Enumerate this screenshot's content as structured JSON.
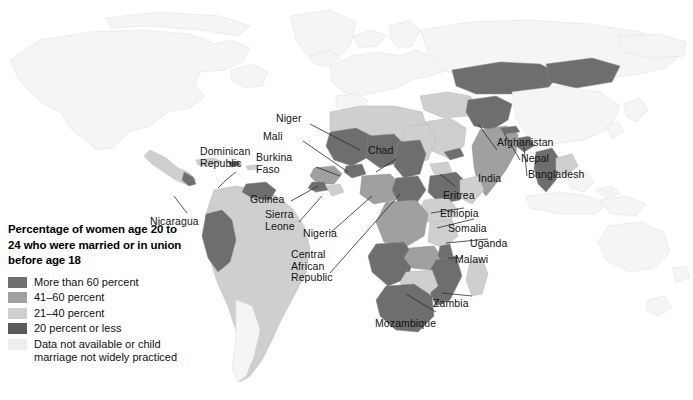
{
  "figure": {
    "kind": "choropleth-world-map",
    "background_color": "#ffffff"
  },
  "legend": {
    "title": "Percentage of women age 20 to 24 who were married or in union before age 18",
    "title_lines": [
      "Percentage of women",
      "age 20 to 24 who were",
      "married or in union before",
      "age 18"
    ],
    "items": [
      {
        "label": "More than 60 percent",
        "color": "#6e6e6e"
      },
      {
        "label": "41–60 percent",
        "color": "#a0a0a0"
      },
      {
        "label": "21–40 percent",
        "color": "#cfcfcf"
      },
      {
        "label": "20 percent or less",
        "color": "#5a5a5a"
      },
      {
        "label": "Data not available or child marriage not widely practiced",
        "color": "#eceeee"
      }
    ]
  },
  "map_labels": [
    {
      "name": "Niger",
      "text": "Niger"
    },
    {
      "name": "Mali",
      "text": "Mali"
    },
    {
      "name": "Burkina Faso",
      "text": "Burkina\nFaso"
    },
    {
      "name": "Chad",
      "text": "Chad"
    },
    {
      "name": "Afghanistan",
      "text": "Afghanistan"
    },
    {
      "name": "Nepal",
      "text": "Nepal"
    },
    {
      "name": "Bangladesh",
      "text": "Bangladesh"
    },
    {
      "name": "India",
      "text": "India"
    },
    {
      "name": "Dominican Republic",
      "text": "Dominican\nRepublic"
    },
    {
      "name": "Guinea",
      "text": "Guinea"
    },
    {
      "name": "Sierra Leone",
      "text": "Sierra\nLeone"
    },
    {
      "name": "Nicaragua",
      "text": "Nicaragua"
    },
    {
      "name": "Eritrea",
      "text": "Eritrea"
    },
    {
      "name": "Ethiopia",
      "text": "Ethiopia"
    },
    {
      "name": "Somalia",
      "text": "Somalia"
    },
    {
      "name": "Uganda",
      "text": "Uganda"
    },
    {
      "name": "Nigeria",
      "text": "Nigeria"
    },
    {
      "name": "Central African Republic",
      "text": "Central\nAfrican\nRepublic"
    },
    {
      "name": "Malawi",
      "text": "Malawi"
    },
    {
      "name": "Zambia",
      "text": "Zambia"
    },
    {
      "name": "Mozambique",
      "text": "Mozambique"
    }
  ],
  "colors": {
    "ocean": "#ffffff",
    "no_data": "#eceeee",
    "band_20_or_less": "#5a5a5a",
    "band_21_40": "#cfcfcf",
    "band_41_60": "#a0a0a0",
    "band_60_plus": "#6e6e6e",
    "border": "#b9bcbe",
    "leader_line": "#2b2b2b",
    "text": "#121212"
  }
}
